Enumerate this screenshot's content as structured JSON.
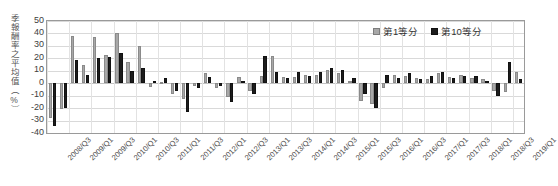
{
  "chart_data": {
    "type": "bar",
    "title": "",
    "xlabel": "",
    "ylabel": "季報酬率之平均值（%）",
    "ylim": [
      -40,
      50
    ],
    "ytick_step": 10,
    "yticks": [
      50,
      40,
      30,
      20,
      10,
      0,
      -10,
      -20,
      -30,
      -40
    ],
    "grid": true,
    "legend_position": "top-right",
    "categories": [
      "2008/Q3",
      "2008/Q4",
      "2009/Q1",
      "2009/Q2",
      "2009/Q3",
      "2009/Q4",
      "2010/Q1",
      "2010/Q2",
      "2010/Q3",
      "2010/Q4",
      "2011/Q1",
      "2011/Q2",
      "2011/Q3",
      "2011/Q4",
      "2012/Q1",
      "2012/Q2",
      "2012/Q3",
      "2012/Q4",
      "2013/Q1",
      "2013/Q2",
      "2013/Q3",
      "2013/Q4",
      "2014/Q1",
      "2014/Q2",
      "2014/Q3",
      "2014/Q4",
      "2015/Q1",
      "2015/Q2",
      "2015/Q3",
      "2015/Q4",
      "2016/Q1",
      "2016/Q2",
      "2016/Q3",
      "2016/Q4",
      "2017/Q1",
      "2017/Q2",
      "2017/Q3",
      "2017/Q4",
      "2018/Q1",
      "2018/Q2",
      "2018/Q3",
      "2018/Q4",
      "2019/Q1"
    ],
    "xtick_labels": [
      "2008/Q3",
      "2009/Q1",
      "2009/Q3",
      "2010/Q1",
      "2010/Q3",
      "2011/Q1",
      "2011/Q3",
      "2012/Q1",
      "2012/Q3",
      "2013/Q1",
      "2013/Q3",
      "2014/Q1",
      "2014/Q3",
      "2015/Q1",
      "2015/Q3",
      "2016/Q1",
      "2016/Q3",
      "2017/Q1",
      "2017/Q3",
      "2018/Q1",
      "2018/Q3",
      "2019/Q1"
    ],
    "xtick_indices": [
      0,
      2,
      4,
      6,
      8,
      10,
      12,
      14,
      16,
      18,
      20,
      22,
      24,
      26,
      28,
      30,
      32,
      34,
      36,
      38,
      40,
      42
    ],
    "series": [
      {
        "name": "第1等分",
        "color": "#a8a8a8",
        "values": [
          -28,
          -21,
          38,
          15,
          37,
          23,
          40,
          17,
          30,
          -3,
          1,
          -9,
          -13,
          -2,
          8,
          -4,
          -11,
          5,
          -6,
          6,
          22,
          5,
          5,
          7,
          7,
          11,
          8,
          2,
          -14,
          -17,
          -4,
          7,
          6,
          4,
          3,
          8,
          5,
          7,
          4,
          3,
          -6,
          -7,
          9
        ]
      },
      {
        "name": "第10等分",
        "color": "#1c1c1c",
        "values": [
          -34,
          -20,
          19,
          7,
          20,
          21,
          24,
          10,
          12,
          2,
          4,
          -6,
          -23,
          -4,
          5,
          -2,
          -15,
          2,
          -9,
          22,
          9,
          4,
          9,
          6,
          9,
          12,
          11,
          4,
          -9,
          -20,
          7,
          4,
          8,
          3,
          6,
          9,
          4,
          6,
          6,
          2,
          -10,
          17,
          3
        ]
      }
    ]
  },
  "legend": {
    "items": [
      {
        "label": "第1等分"
      },
      {
        "label": "第10等分"
      }
    ]
  },
  "caption": ""
}
